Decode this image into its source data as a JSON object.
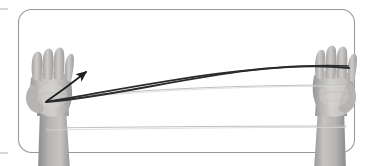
{
  "panel": {
    "label": "exercise-illustration-panel",
    "border_color": "#9a9a9a",
    "border_width": 1.1,
    "corner_radius": 13,
    "background": "#ffffff",
    "x": 18,
    "y": 9,
    "width": 337,
    "height": 144
  },
  "neighbor_panel": {
    "label": "adjacent-panel-edge-sliver",
    "border_color": "#b4b4b4",
    "x": 0,
    "y": 9,
    "width": 6,
    "height": 144,
    "corner_radius": 13
  },
  "hands": {
    "left": {
      "label": "left-hand-open-palm-photo",
      "center_x": 55,
      "top_y": 50,
      "width": 62,
      "height": 116,
      "skin_light": "#d6d4d2",
      "skin_mid": "#b2b0ae",
      "skin_dark": "#8e8c8a",
      "shadow": "#7a7876"
    },
    "right": {
      "label": "right-hand-open-palm-photo",
      "center_x": 333,
      "top_y": 47,
      "width": 60,
      "height": 119,
      "skin_light": "#d6d4d2",
      "skin_mid": "#b2b0ae",
      "skin_dark": "#8e8c8a",
      "shadow": "#7a7876"
    }
  },
  "elastic_band": {
    "label": "resistance-band",
    "color": "#b9b9b9",
    "highlight": "#d8d8d8",
    "stroke_width": 0.9,
    "strands": [
      {
        "name": "upper-strand",
        "y_left": 100,
        "y_right": 85
      },
      {
        "name": "upper-strand-return",
        "y_left": 86,
        "y_right": 85
      },
      {
        "name": "lower-strand",
        "y_left": 128,
        "y_right": 126
      },
      {
        "name": "lower-strand-return",
        "y_left": 130,
        "y_right": 127
      }
    ]
  },
  "motion_arc": {
    "label": "motion-path-curve",
    "color": "#2b2b2b",
    "stroke_width": 1.9,
    "start_x": 46,
    "start_y": 102,
    "end_x": 349,
    "end_y": 68,
    "apex_x": 250,
    "apex_y": 58
  },
  "return_arc": {
    "label": "motion-path-return-curve",
    "color": "#2b2b2b",
    "stroke_width": 1.7,
    "start_x": 348,
    "start_y": 66,
    "end_x": 46,
    "end_y": 102
  },
  "arrow": {
    "label": "direction-arrowhead",
    "color": "#1f1f1f",
    "tip_x": 89,
    "tip_y": 70,
    "tail_x": 47,
    "tail_y": 101,
    "stroke_width": 1.8,
    "head_length": 9,
    "head_width": 6
  },
  "accessibility": {
    "alt_text": "Two open hands stretching an elastic resistance band horizontally, with a curved arrow showing the direction of movement."
  }
}
